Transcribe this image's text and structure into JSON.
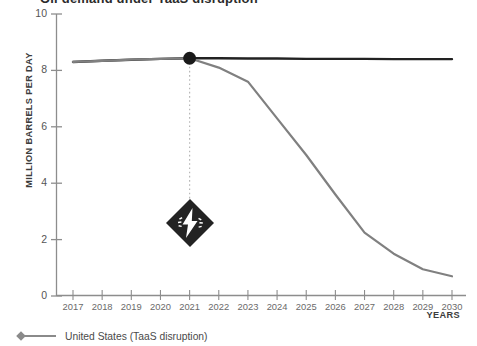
{
  "chart_data": {
    "type": "line",
    "title": "Oil demand under TaaS disruption",
    "xlabel": "YEARS",
    "ylabel": "MILLION BARRELS PER DAY",
    "xlim": [
      2017,
      2030
    ],
    "ylim": [
      0,
      10
    ],
    "grid": false,
    "legend_position": "bottom-left",
    "categories": [
      2017,
      2018,
      2019,
      2020,
      2021,
      2022,
      2023,
      2024,
      2025,
      2026,
      2027,
      2028,
      2029,
      2030
    ],
    "x_tick_labels": [
      "2017",
      "2018",
      "2019",
      "2020",
      "2021",
      "2022",
      "2023",
      "2024",
      "2025",
      "2026",
      "2027",
      "2028",
      "2029",
      "2030"
    ],
    "y_tick_labels": [
      "0",
      "2",
      "4",
      "6",
      "8",
      "10"
    ],
    "y_ticks": [
      0,
      2,
      4,
      6,
      8,
      10
    ],
    "series": [
      {
        "name": "Baseline",
        "color": "#222222",
        "style": "solid",
        "width": 2.4,
        "values": [
          8.3,
          8.34,
          8.38,
          8.41,
          8.43,
          8.43,
          8.42,
          8.42,
          8.41,
          8.41,
          8.41,
          8.4,
          8.4,
          8.4
        ]
      },
      {
        "name": "United States (TaaS disruption)",
        "color": "#808080",
        "style": "solid",
        "width": 2.2,
        "values": [
          8.3,
          8.34,
          8.38,
          8.41,
          8.43,
          8.1,
          7.6,
          6.3,
          5.0,
          3.6,
          2.25,
          1.5,
          0.95,
          0.7
        ]
      }
    ],
    "annotations": [
      {
        "name": "disruption-point",
        "type": "marker",
        "x": 2021,
        "y": 8.43,
        "color": "#1a1a1a",
        "label": ""
      },
      {
        "name": "disruption-badge",
        "type": "icon-badge",
        "icon": "lightning-bolt-icon",
        "x": 2021,
        "y": 2.6,
        "color": "#222222"
      }
    ]
  },
  "legend": {
    "items": [
      {
        "label": "United States (TaaS disruption)",
        "marker": "diamond",
        "color": "#808080"
      }
    ]
  },
  "axes": {
    "x_title": "YEARS",
    "y_title": "MILLION BARRELS PER DAY"
  }
}
